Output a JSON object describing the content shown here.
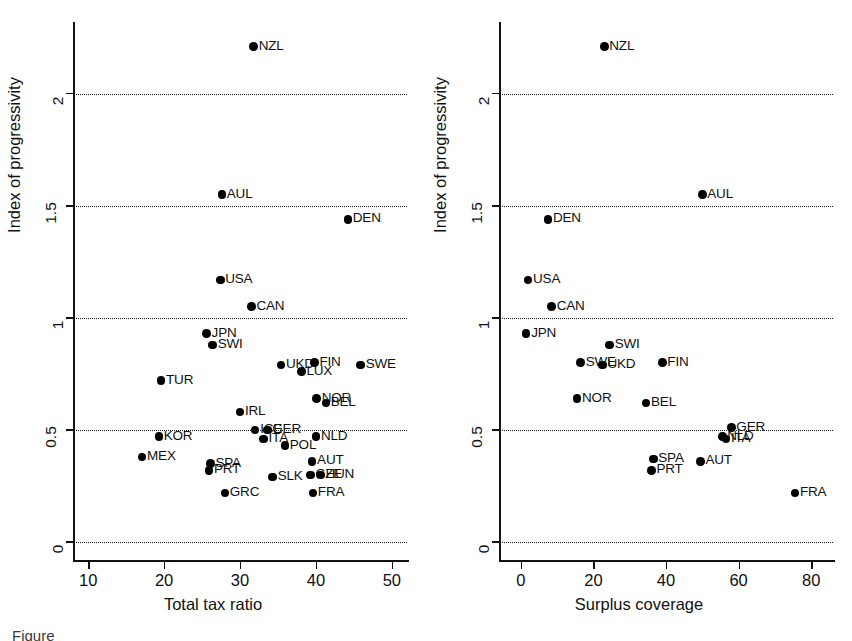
{
  "figure": {
    "caption_fragment": "Figure",
    "panels": [
      "left",
      "right"
    ]
  },
  "chart_data": [
    {
      "type": "scatter",
      "panel": "left",
      "title": "",
      "xlabel": "Total tax ratio",
      "ylabel": "Index of progressivity",
      "xlim": [
        8,
        52
      ],
      "ylim": [
        -0.08,
        2.32
      ],
      "xticks": [
        10,
        20,
        30,
        40,
        50
      ],
      "xtick_labels": [
        "10",
        "20",
        "30",
        "40",
        "50"
      ],
      "yticks": [
        0,
        0.5,
        1,
        1.5,
        2
      ],
      "ytick_labels": [
        "0",
        "0.5",
        "1",
        "1.5",
        "2"
      ],
      "grid": "horizontal-dotted",
      "gridlines_at": [
        0,
        0.5,
        1,
        1.5,
        2
      ],
      "legend": "none",
      "point_labels_position": "right-of-marker",
      "points": [
        {
          "label": "NZL",
          "x": 31.8,
          "y": 2.21
        },
        {
          "label": "AUL",
          "x": 27.6,
          "y": 1.55
        },
        {
          "label": "DEN",
          "x": 44.2,
          "y": 1.44
        },
        {
          "label": "USA",
          "x": 27.4,
          "y": 1.17
        },
        {
          "label": "CAN",
          "x": 31.5,
          "y": 1.05
        },
        {
          "label": "JPN",
          "x": 25.6,
          "y": 0.93
        },
        {
          "label": "SWI",
          "x": 26.4,
          "y": 0.88
        },
        {
          "label": "UKD",
          "x": 35.4,
          "y": 0.79
        },
        {
          "label": "FIN",
          "x": 39.8,
          "y": 0.8
        },
        {
          "label": "LUX",
          "x": 38.1,
          "y": 0.76
        },
        {
          "label": "SWE",
          "x": 45.9,
          "y": 0.79
        },
        {
          "label": "TUR",
          "x": 19.6,
          "y": 0.72
        },
        {
          "label": "NOR",
          "x": 40.1,
          "y": 0.64
        },
        {
          "label": "BEL",
          "x": 41.3,
          "y": 0.62
        },
        {
          "label": "IRL",
          "x": 30.0,
          "y": 0.58
        },
        {
          "label": "KOR",
          "x": 19.3,
          "y": 0.47
        },
        {
          "label": "ICE",
          "x": 32.0,
          "y": 0.5
        },
        {
          "label": "GER",
          "x": 33.6,
          "y": 0.5
        },
        {
          "label": "ITA",
          "x": 33.1,
          "y": 0.46
        },
        {
          "label": "NLD",
          "x": 40.0,
          "y": 0.47
        },
        {
          "label": "POL",
          "x": 35.9,
          "y": 0.43
        },
        {
          "label": "MEX",
          "x": 17.1,
          "y": 0.38
        },
        {
          "label": "SPA",
          "x": 26.1,
          "y": 0.35
        },
        {
          "label": "PRT",
          "x": 25.9,
          "y": 0.32
        },
        {
          "label": "AUT",
          "x": 39.5,
          "y": 0.36
        },
        {
          "label": "CZE",
          "x": 39.3,
          "y": 0.3
        },
        {
          "label": "HUN",
          "x": 40.6,
          "y": 0.3
        },
        {
          "label": "SLK",
          "x": 34.3,
          "y": 0.29
        },
        {
          "label": "GRC",
          "x": 28.0,
          "y": 0.22
        },
        {
          "label": "FRA",
          "x": 39.6,
          "y": 0.22
        }
      ]
    },
    {
      "type": "scatter",
      "panel": "right",
      "title": "",
      "xlabel": "Surplus coverage",
      "ylabel": "Index of progressivity",
      "xlim": [
        -6,
        86
      ],
      "ylim": [
        -0.08,
        2.32
      ],
      "xticks": [
        0,
        20,
        40,
        60,
        80
      ],
      "xtick_labels": [
        "0",
        "20",
        "40",
        "60",
        "80"
      ],
      "yticks": [
        0,
        0.5,
        1,
        1.5,
        2
      ],
      "ytick_labels": [
        "0",
        "0.5",
        "1",
        "1.5",
        "2"
      ],
      "grid": "horizontal-dotted",
      "gridlines_at": [
        0,
        0.5,
        1,
        1.5,
        2
      ],
      "legend": "none",
      "point_labels_position": "right-of-marker",
      "points": [
        {
          "label": "NZL",
          "x": 23.0,
          "y": 2.21
        },
        {
          "label": "AUL",
          "x": 50.0,
          "y": 1.55
        },
        {
          "label": "DEN",
          "x": 7.5,
          "y": 1.44
        },
        {
          "label": "USA",
          "x": 2.0,
          "y": 1.17
        },
        {
          "label": "CAN",
          "x": 8.5,
          "y": 1.05
        },
        {
          "label": "JPN",
          "x": 1.5,
          "y": 0.93
        },
        {
          "label": "SWI",
          "x": 24.5,
          "y": 0.88
        },
        {
          "label": "SWE",
          "x": 16.5,
          "y": 0.8
        },
        {
          "label": "UKD",
          "x": 22.5,
          "y": 0.79
        },
        {
          "label": "FIN",
          "x": 39.0,
          "y": 0.8
        },
        {
          "label": "NOR",
          "x": 15.5,
          "y": 0.64
        },
        {
          "label": "BEL",
          "x": 34.5,
          "y": 0.62
        },
        {
          "label": "GER",
          "x": 58.0,
          "y": 0.51
        },
        {
          "label": "NLD",
          "x": 55.5,
          "y": 0.47
        },
        {
          "label": "ITA",
          "x": 56.5,
          "y": 0.46
        },
        {
          "label": "SPA",
          "x": 36.5,
          "y": 0.37
        },
        {
          "label": "PRT",
          "x": 36.0,
          "y": 0.32
        },
        {
          "label": "AUT",
          "x": 49.5,
          "y": 0.36
        },
        {
          "label": "FRA",
          "x": 75.5,
          "y": 0.22
        }
      ]
    }
  ]
}
